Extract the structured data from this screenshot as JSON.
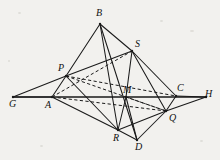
{
  "figure": {
    "background_color": "#f2f1ee",
    "ink_color": "#1a1a1a",
    "width": 220,
    "height": 160
  },
  "labels": {
    "B": "B",
    "S": "S",
    "P": "P",
    "C": "C",
    "H": "H",
    "G": "G",
    "A": "A",
    "M": "M",
    "Q": "Q",
    "R": "R",
    "D": "D"
  },
  "points": {
    "B": {
      "x": 100,
      "y": 24,
      "label_x": 96,
      "label_y": 8
    },
    "S": {
      "x": 132,
      "y": 51,
      "label_x": 135,
      "label_y": 39
    },
    "P": {
      "x": 66,
      "y": 76,
      "label_x": 58,
      "label_y": 63
    },
    "C": {
      "x": 176,
      "y": 96,
      "label_x": 177,
      "label_y": 83
    },
    "H": {
      "x": 206,
      "y": 97,
      "label_x": 205,
      "label_y": 89
    },
    "G": {
      "x": 13,
      "y": 97,
      "label_x": 9,
      "label_y": 99
    },
    "A": {
      "x": 52,
      "y": 97,
      "label_x": 45,
      "label_y": 100
    },
    "M": {
      "x": 126,
      "y": 97,
      "label_x": 123,
      "label_y": 85
    },
    "Q": {
      "x": 166,
      "y": 111,
      "label_x": 169,
      "label_y": 113
    },
    "R": {
      "x": 118,
      "y": 130,
      "label_x": 113,
      "label_y": 133
    },
    "D": {
      "x": 137,
      "y": 140,
      "label_x": 135,
      "label_y": 142
    }
  },
  "edges": {
    "solid": [
      {
        "name": "edge-B-P",
        "from": "B",
        "to": "P"
      },
      {
        "name": "edge-B-S",
        "from": "B",
        "to": "S"
      },
      {
        "name": "edge-B-R",
        "from": "B",
        "to": "R"
      },
      {
        "name": "edge-B-D",
        "from": "B",
        "to": "D"
      },
      {
        "name": "edge-P-S",
        "from": "P",
        "to": "S"
      },
      {
        "name": "edge-P-A",
        "from": "P",
        "to": "A"
      },
      {
        "name": "edge-P-R",
        "from": "P",
        "to": "R"
      },
      {
        "name": "edge-S-C",
        "from": "S",
        "to": "C"
      },
      {
        "name": "edge-S-M",
        "from": "S",
        "to": "M"
      },
      {
        "name": "edge-S-Q",
        "from": "S",
        "to": "Q"
      },
      {
        "name": "edge-A-R",
        "from": "A",
        "to": "R"
      },
      {
        "name": "edge-A-G",
        "from": "A",
        "to": "G"
      },
      {
        "name": "edge-G-P",
        "from": "G",
        "to": "P"
      },
      {
        "name": "edge-C-Q",
        "from": "C",
        "to": "Q"
      },
      {
        "name": "edge-C-H",
        "from": "C",
        "to": "H"
      },
      {
        "name": "edge-Q-H",
        "from": "Q",
        "to": "H"
      },
      {
        "name": "edge-R-D",
        "from": "R",
        "to": "D"
      },
      {
        "name": "edge-R-Q",
        "from": "R",
        "to": "Q"
      },
      {
        "name": "edge-D-Q",
        "from": "D",
        "to": "Q"
      },
      {
        "name": "edge-M-R",
        "from": "M",
        "to": "R"
      },
      {
        "name": "edge-M-D",
        "from": "M",
        "to": "D"
      }
    ],
    "dashed": [
      {
        "name": "edge-P-C-dashed",
        "from": "P",
        "to": "C"
      },
      {
        "name": "edge-A-S-dashed",
        "from": "A",
        "to": "S"
      },
      {
        "name": "edge-P-Q-dashed",
        "from": "P",
        "to": "Q"
      },
      {
        "name": "edge-A-Q-dashed",
        "from": "A",
        "to": "Q"
      },
      {
        "name": "edge-M-Q-dashed",
        "from": "M",
        "to": "Q"
      }
    ],
    "axis": [
      {
        "name": "edge-G-H-axis",
        "from": "G",
        "to": "H"
      }
    ]
  }
}
